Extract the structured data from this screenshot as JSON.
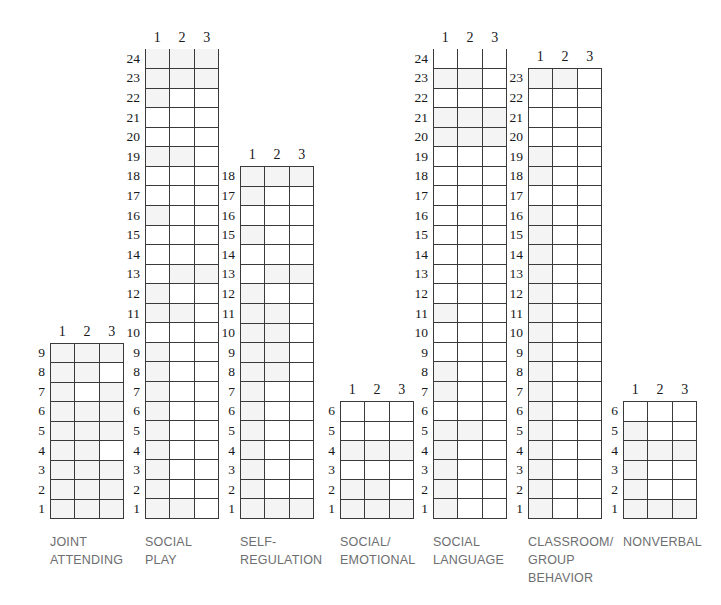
{
  "figure": {
    "type": "profile-grid-chart",
    "background": "#ffffff",
    "grid_line_color": "#3a3a3a",
    "cell_tint_color": "#f4f4f4",
    "caption_color": "#6d6e70",
    "number_color": "#16181a"
  },
  "column_headers": [
    "1",
    "2",
    "3"
  ],
  "chart_data": {
    "type": "table",
    "title": "",
    "xlabel": "",
    "ylabel": "",
    "legend": [],
    "grid": true,
    "column_headers": [
      "1",
      "2",
      "3"
    ],
    "domains": [
      {
        "name": "JOINT\nATTENDING",
        "max": 9,
        "min": 1,
        "rows": [
          9,
          8,
          7,
          6,
          5,
          4,
          3,
          2,
          1
        ]
      },
      {
        "name": "SOCIAL\nPLAY",
        "max": 24,
        "min": 1,
        "rows": [
          24,
          23,
          22,
          21,
          20,
          19,
          18,
          17,
          16,
          15,
          14,
          13,
          12,
          11,
          10,
          9,
          8,
          7,
          6,
          5,
          4,
          3,
          2,
          1
        ]
      },
      {
        "name": "SELF-\nREGULATION",
        "max": 18,
        "min": 1,
        "rows": [
          18,
          17,
          16,
          15,
          14,
          13,
          12,
          11,
          10,
          9,
          8,
          7,
          6,
          5,
          4,
          3,
          2,
          1
        ]
      },
      {
        "name": "SOCIAL/\nEMOTIONAL",
        "max": 6,
        "min": 1,
        "rows": [
          6,
          5,
          4,
          3,
          2,
          1
        ]
      },
      {
        "name": "SOCIAL\nLANGUAGE",
        "max": 24,
        "min": 1,
        "rows": [
          24,
          23,
          22,
          21,
          20,
          19,
          18,
          17,
          16,
          15,
          14,
          13,
          12,
          11,
          10,
          9,
          8,
          7,
          6,
          5,
          4,
          3,
          2,
          1
        ]
      },
      {
        "name": "CLASSROOM/\nGROUP\nBEHAVIOR",
        "max": 23,
        "min": 1,
        "rows": [
          23,
          22,
          21,
          20,
          19,
          18,
          17,
          16,
          15,
          14,
          13,
          12,
          11,
          10,
          9,
          8,
          7,
          6,
          5,
          4,
          3,
          2,
          1
        ]
      },
      {
        "name": "NONVERBAL",
        "max": 6,
        "min": 1,
        "rows": [
          6,
          5,
          4,
          3,
          2,
          1
        ]
      }
    ]
  },
  "layout": {
    "row_height": 19.6,
    "grid_width": 74,
    "baseline_y": 519,
    "domains": [
      {
        "key": "joint-attending",
        "left": 50,
        "label_width": 118
      },
      {
        "key": "social-play",
        "left": 145,
        "label_width": 118
      },
      {
        "key": "self-regulation",
        "left": 240,
        "label_width": 128
      },
      {
        "key": "social-emotional",
        "left": 340,
        "label_width": 118
      },
      {
        "key": "social-language",
        "left": 433,
        "label_width": 118
      },
      {
        "key": "classroom-group-behavior",
        "left": 528,
        "label_width": 118
      },
      {
        "key": "nonverbal",
        "left": 623,
        "label_width": 118
      }
    ]
  },
  "tints": {
    "joint-attending": [
      [
        9,
        1
      ],
      [
        9,
        2
      ],
      [
        9,
        3
      ],
      [
        8,
        1
      ],
      [
        8,
        2
      ],
      [
        7,
        1
      ],
      [
        7,
        3
      ],
      [
        6,
        1
      ],
      [
        6,
        2
      ],
      [
        6,
        3
      ],
      [
        5,
        1
      ],
      [
        5,
        2
      ],
      [
        5,
        3
      ],
      [
        4,
        1
      ],
      [
        4,
        2
      ],
      [
        3,
        1
      ],
      [
        3,
        2
      ],
      [
        3,
        3
      ],
      [
        2,
        1
      ],
      [
        2,
        2
      ],
      [
        2,
        3
      ],
      [
        1,
        1
      ],
      [
        1,
        2
      ],
      [
        1,
        3
      ]
    ],
    "social-play": [
      [
        24,
        1
      ],
      [
        24,
        2
      ],
      [
        24,
        3
      ],
      [
        23,
        1
      ],
      [
        23,
        2
      ],
      [
        23,
        3
      ],
      [
        22,
        1
      ],
      [
        19,
        1
      ],
      [
        19,
        2
      ],
      [
        16,
        1
      ],
      [
        13,
        2
      ],
      [
        13,
        3
      ],
      [
        12,
        1
      ],
      [
        11,
        1
      ],
      [
        11,
        2
      ],
      [
        9,
        1
      ],
      [
        8,
        1
      ],
      [
        7,
        1
      ],
      [
        6,
        1
      ],
      [
        5,
        1
      ],
      [
        4,
        1
      ],
      [
        3,
        1
      ],
      [
        2,
        1
      ],
      [
        1,
        1
      ],
      [
        1,
        2
      ]
    ],
    "self-regulation": [
      [
        18,
        1
      ],
      [
        18,
        2
      ],
      [
        18,
        3
      ],
      [
        17,
        1
      ],
      [
        15,
        1
      ],
      [
        13,
        2
      ],
      [
        13,
        3
      ],
      [
        12,
        1
      ],
      [
        11,
        1
      ],
      [
        11,
        2
      ],
      [
        10,
        1
      ],
      [
        10,
        2
      ],
      [
        9,
        1
      ],
      [
        9,
        2
      ],
      [
        8,
        1
      ],
      [
        8,
        2
      ],
      [
        7,
        1
      ],
      [
        6,
        1
      ],
      [
        5,
        1
      ],
      [
        4,
        1
      ],
      [
        3,
        1
      ],
      [
        2,
        1
      ],
      [
        1,
        1
      ],
      [
        1,
        2
      ],
      [
        1,
        3
      ]
    ],
    "social-emotional": [
      [
        4,
        1
      ],
      [
        4,
        2
      ],
      [
        4,
        3
      ],
      [
        2,
        1
      ],
      [
        2,
        2
      ],
      [
        1,
        1
      ],
      [
        1,
        2
      ],
      [
        1,
        3
      ]
    ],
    "social-language": [
      [
        23,
        1
      ],
      [
        23,
        2
      ],
      [
        21,
        1
      ],
      [
        21,
        2
      ],
      [
        21,
        3
      ],
      [
        20,
        1
      ],
      [
        20,
        2
      ],
      [
        20,
        3
      ],
      [
        11,
        1
      ],
      [
        8,
        1
      ],
      [
        7,
        1
      ],
      [
        5,
        1
      ],
      [
        5,
        2
      ],
      [
        4,
        1
      ],
      [
        3,
        1
      ],
      [
        2,
        1
      ],
      [
        1,
        1
      ]
    ],
    "classroom-group-behavior": [
      [
        23,
        1
      ],
      [
        23,
        2
      ],
      [
        19,
        1
      ],
      [
        18,
        1
      ],
      [
        16,
        1
      ],
      [
        15,
        1
      ],
      [
        14,
        1
      ],
      [
        13,
        1
      ],
      [
        12,
        1
      ],
      [
        11,
        1
      ],
      [
        10,
        1
      ],
      [
        9,
        1
      ],
      [
        8,
        1
      ],
      [
        7,
        1
      ],
      [
        6,
        1
      ],
      [
        5,
        1
      ],
      [
        4,
        1
      ],
      [
        3,
        1
      ],
      [
        2,
        1
      ],
      [
        1,
        1
      ]
    ],
    "nonverbal": [
      [
        5,
        1
      ],
      [
        4,
        1
      ],
      [
        4,
        2
      ],
      [
        4,
        3
      ],
      [
        3,
        1
      ],
      [
        2,
        1
      ],
      [
        1,
        1
      ],
      [
        1,
        2
      ],
      [
        1,
        3
      ]
    ]
  }
}
